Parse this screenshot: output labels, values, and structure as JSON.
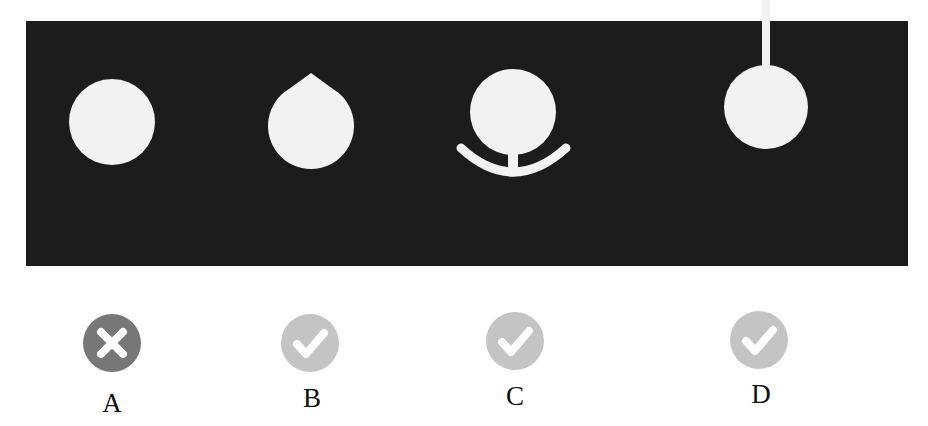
{
  "diagram": {
    "panel_color": "#1c1c1c",
    "shape_color": "#f2f2f2",
    "options": [
      {
        "id": "A",
        "label": "A",
        "shape": "plain-circle",
        "status": "incorrect",
        "badge_icon": "x-circle-icon",
        "badge_color": "#777777"
      },
      {
        "id": "B",
        "label": "B",
        "shape": "teardrop-pointed-top",
        "status": "correct",
        "badge_icon": "check-circle-icon",
        "badge_color": "#c4c4c4"
      },
      {
        "id": "C",
        "label": "C",
        "shape": "circle-with-arc-base",
        "status": "correct",
        "badge_icon": "check-circle-icon",
        "badge_color": "#c4c4c4"
      },
      {
        "id": "D",
        "label": "D",
        "shape": "circle-hanging-from-stem",
        "status": "correct",
        "badge_icon": "check-circle-icon",
        "badge_color": "#c4c4c4"
      }
    ]
  }
}
